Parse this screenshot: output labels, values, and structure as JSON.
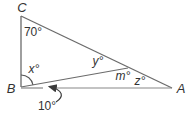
{
  "diagram": {
    "kind": "triangle-with-cevian",
    "vertices": {
      "C": "C",
      "B": "B",
      "A": "A"
    },
    "angles": {
      "at_C": "70°",
      "x_at_B": "x°",
      "y_at_D": "y°",
      "m_at_D": "m°",
      "z_at_A": "z°",
      "ten_at_B": "10°"
    },
    "colors": {
      "line": "#6b6b6b",
      "baseline": "#878787",
      "arrow": "#3a3a3a",
      "text": "#333333",
      "background": "#ffffff"
    }
  }
}
